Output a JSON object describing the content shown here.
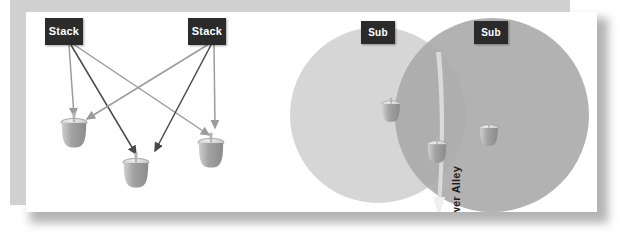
{
  "figure": {
    "panels": [
      {
        "name": "left-panel",
        "description": "Two Stack emitters targeting three dome units"
      },
      {
        "name": "right-panel",
        "description": "Two overlapping Sub coverage circles forming a Power Alley"
      }
    ]
  },
  "labels": {
    "stack_left": "Stack",
    "stack_right": "Stack",
    "sub_left": "Sub",
    "sub_right": "Sub",
    "power_alley": "Power Alley"
  },
  "colors": {
    "chip_background": "#2b2b2b",
    "chip_text": "#ffffff",
    "page_background": "#ffffff",
    "backing_panel": "#d0d0d0",
    "arrow_dark": "#4a4a4a",
    "arrow_light": "#9b9b9b",
    "circle_left": "#d6d6d6",
    "circle_right": "#b2b2b2",
    "circle_overlap": "#a8a8a8",
    "power_alley_fill": "#e8e8e8",
    "unit_body": "#9a9a9a",
    "unit_cap": "#d8d8d8"
  },
  "diagram_data": {
    "type": "diagram",
    "stacks": [
      {
        "id": "stack-left",
        "label": "Stack",
        "x": 64,
        "y": 45,
        "arrow_color": "#9b9b9b"
      },
      {
        "id": "stack-right",
        "label": "Stack",
        "x": 207,
        "y": 45,
        "arrow_color": "#4a4a4a"
      }
    ],
    "units_left_panel": [
      {
        "id": "unit-a",
        "x": 74,
        "y": 130
      },
      {
        "id": "unit-b",
        "x": 134,
        "y": 176
      },
      {
        "id": "unit-c",
        "x": 208,
        "y": 152
      }
    ],
    "arrows": [
      {
        "from": "stack-left",
        "to": "unit-a",
        "color": "#9b9b9b"
      },
      {
        "from": "stack-left",
        "to": "unit-b",
        "color": "#4a4a4a"
      },
      {
        "from": "stack-left",
        "to": "unit-c",
        "color": "#9b9b9b"
      },
      {
        "from": "stack-right",
        "to": "unit-a",
        "color": "#9b9b9b"
      },
      {
        "from": "stack-right",
        "to": "unit-b",
        "color": "#4a4a4a"
      },
      {
        "from": "stack-right",
        "to": "unit-c",
        "color": "#9b9b9b"
      }
    ],
    "subs": [
      {
        "id": "sub-left",
        "label": "Sub",
        "cx": 378,
        "cy": 115,
        "r": 88,
        "fill": "#d6d6d6"
      },
      {
        "id": "sub-right",
        "label": "Sub",
        "cx": 492,
        "cy": 115,
        "r": 97,
        "fill": "#b2b2b2"
      }
    ],
    "units_right_panel": [
      {
        "id": "unit-d",
        "x": 391,
        "y": 100
      },
      {
        "id": "unit-e",
        "x": 489,
        "y": 124
      },
      {
        "id": "unit-f",
        "x": 436,
        "y": 140
      }
    ],
    "power_alley": {
      "label": "Power Alley",
      "description": "Narrow overlap corridor between the two Sub coverage circles",
      "x": 436,
      "top": 60,
      "bottom": 233
    }
  }
}
